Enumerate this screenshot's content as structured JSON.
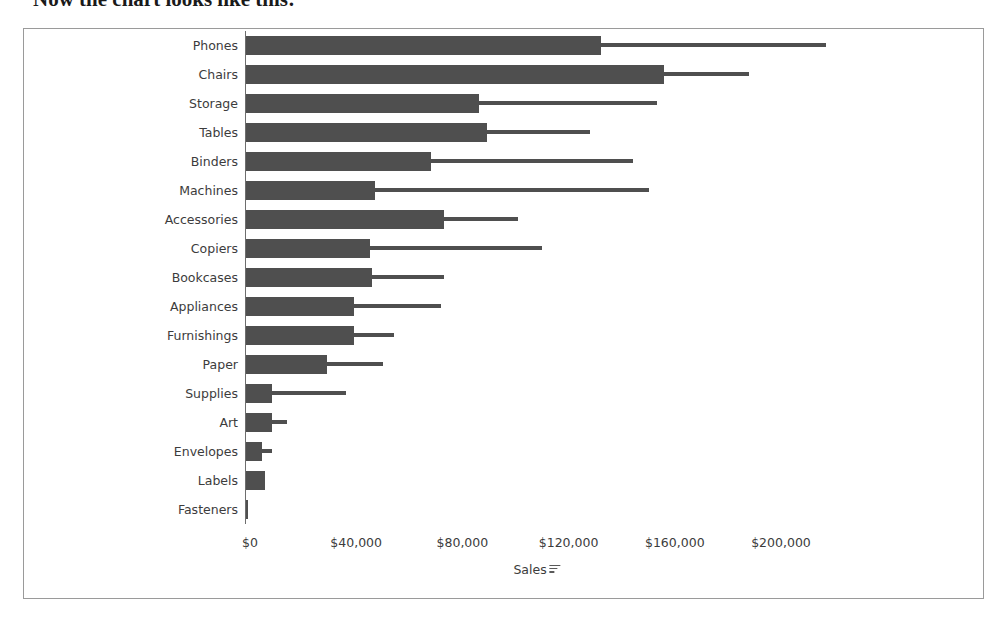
{
  "page": {
    "caption": "Now the chart looks like this:"
  },
  "chart_data": {
    "type": "bar",
    "orientation": "horizontal",
    "title": "",
    "xlabel": "Sales",
    "ylabel": "",
    "xlim": [
      0,
      220000
    ],
    "grid": false,
    "legend": false,
    "sort_indicator": "descending",
    "axis_tick_labels": [
      "$0",
      "$40,000",
      "$80,000",
      "$120,000",
      "$160,000",
      "$200,000"
    ],
    "axis_tick_values": [
      0,
      40000,
      80000,
      120000,
      160000,
      200000
    ],
    "bar_color": "#4f4f4f",
    "reference_color": "#4f4f4f",
    "categories": [
      "Phones",
      "Chairs",
      "Storage",
      "Tables",
      "Binders",
      "Machines",
      "Accessories",
      "Copiers",
      "Bookcases",
      "Appliances",
      "Furnishings",
      "Paper",
      "Supplies",
      "Art",
      "Envelopes",
      "Labels",
      "Fasteners"
    ],
    "series": [
      {
        "name": "Sales",
        "values": [
          134000,
          158000,
          88000,
          91000,
          70000,
          49000,
          75000,
          47000,
          48000,
          41000,
          41000,
          31000,
          10000,
          10000,
          6500,
          7500,
          1000
        ]
      },
      {
        "name": "Reference",
        "values": [
          219000,
          190000,
          155000,
          130000,
          146000,
          152000,
          103000,
          112000,
          75000,
          74000,
          56000,
          52000,
          38000,
          16000,
          10000,
          0,
          0
        ]
      }
    ]
  }
}
